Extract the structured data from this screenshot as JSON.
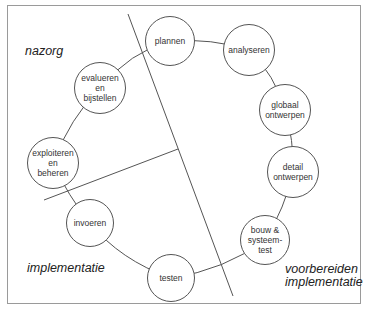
{
  "diagram": {
    "type": "cyclic process diagram",
    "colors": {
      "frame_border": "#9a9a9a",
      "line": "#555555",
      "text": "#333333",
      "background": "#ffffff"
    },
    "phases": {
      "nazorg": {
        "lines": [
          "nazorg"
        ]
      },
      "implementatie": {
        "lines": [
          "implementatie"
        ]
      },
      "voorbereiden_implementatie": {
        "lines": [
          "voorbereiden",
          "implementatie"
        ]
      }
    },
    "nodes": [
      {
        "id": "plannen",
        "lines": [
          "plannen"
        ],
        "cx": 170,
        "cy": 41,
        "r": 25
      },
      {
        "id": "analyseren",
        "lines": [
          "analyseren"
        ],
        "cx": 249,
        "cy": 50,
        "r": 26
      },
      {
        "id": "globaal-ontwerpen",
        "lines": [
          "globaal",
          "ontwerpen"
        ],
        "cx": 285,
        "cy": 110,
        "r": 26
      },
      {
        "id": "detail-ontwerpen",
        "lines": [
          "detail",
          "ontwerpen"
        ],
        "cx": 293,
        "cy": 172,
        "r": 26
      },
      {
        "id": "bouw-systeemtest",
        "lines": [
          "bouw &",
          "systeem-",
          "test"
        ],
        "cx": 265,
        "cy": 240,
        "r": 25
      },
      {
        "id": "testen",
        "lines": [
          "testen"
        ],
        "cx": 171,
        "cy": 278,
        "r": 24
      },
      {
        "id": "invoeren",
        "lines": [
          "invoeren"
        ],
        "cx": 90,
        "cy": 223,
        "r": 24
      },
      {
        "id": "exploiteren-en-beheren",
        "lines": [
          "exploiteren",
          "en",
          "beheren"
        ],
        "cx": 53,
        "cy": 163,
        "r": 26
      },
      {
        "id": "evalueren-en-bijstellen",
        "lines": [
          "evalueren",
          "en",
          "bijstellen"
        ],
        "cx": 100,
        "cy": 88,
        "r": 26
      }
    ],
    "dividers": [
      {
        "id": "main-divider",
        "x1": 128,
        "y1": 14,
        "x2": 233,
        "y2": 296
      },
      {
        "id": "short-divider",
        "x1": 44,
        "y1": 200,
        "x2": 178,
        "y2": 149
      }
    ]
  }
}
